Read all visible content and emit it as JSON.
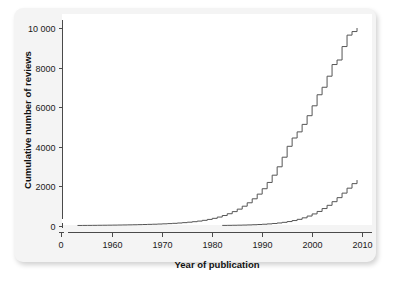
{
  "figure": {
    "panel_background": "#f4f4f4",
    "plot_background": "#ffffff",
    "line_color": "#555555",
    "axis_color": "#4a4a4a"
  },
  "chart_data": {
    "type": "line",
    "title": "",
    "subtitle": "",
    "xlabel": "Year of publication",
    "ylabel": "Cumulative number of reviews",
    "xlim": [
      1950,
      2012
    ],
    "ylim": [
      0,
      10400
    ],
    "grid": false,
    "legend": null,
    "legend_position": "none",
    "xticks": [
      0,
      1960,
      1970,
      1980,
      1990,
      2000,
      2010
    ],
    "xtick_labels": [
      "0",
      "1960",
      "1970",
      "1980",
      "1990",
      "2000",
      "2010"
    ],
    "yticks": [
      0,
      2000,
      4000,
      6000,
      8000,
      10000
    ],
    "ytick_labels": [
      "0",
      "2000",
      "4000",
      "6000",
      "8000",
      "10 000"
    ],
    "axis_break_x": true,
    "axis_break_y": true,
    "step_type": "post",
    "series": [
      {
        "name": "upper-curve",
        "style": "step",
        "x": [
          1953,
          1954,
          1955,
          1956,
          1957,
          1958,
          1959,
          1960,
          1961,
          1962,
          1963,
          1964,
          1965,
          1966,
          1967,
          1968,
          1969,
          1970,
          1971,
          1972,
          1973,
          1974,
          1975,
          1976,
          1977,
          1978,
          1979,
          1980,
          1981,
          1982,
          1983,
          1984,
          1985,
          1986,
          1987,
          1988,
          1989,
          1990,
          1991,
          1992,
          1993,
          1994,
          1995,
          1996,
          1997,
          1998,
          1999,
          2000,
          2001,
          2002,
          2003,
          2004,
          2005,
          2006,
          2007,
          2008,
          2009
        ],
        "values": [
          2,
          4,
          6,
          8,
          11,
          14,
          17,
          20,
          24,
          28,
          33,
          38,
          44,
          50,
          57,
          65,
          74,
          84,
          96,
          110,
          126,
          145,
          167,
          193,
          224,
          262,
          308,
          363,
          428,
          505,
          596,
          703,
          829,
          977,
          1150,
          1352,
          1588,
          1862,
          2180,
          2548,
          2972,
          3458,
          4010,
          4430,
          4740,
          5120,
          5560,
          6060,
          6620,
          7000,
          7560,
          8150,
          8380,
          9060,
          9640,
          9820,
          10000
        ]
      },
      {
        "name": "lower-curve",
        "style": "step",
        "x": [
          1982,
          1983,
          1984,
          1985,
          1986,
          1987,
          1988,
          1989,
          1990,
          1991,
          1992,
          1993,
          1994,
          1995,
          1996,
          1997,
          1998,
          1999,
          2000,
          2001,
          2002,
          2003,
          2004,
          2005,
          2006,
          2007,
          2008,
          2009
        ],
        "values": [
          5,
          8,
          12,
          17,
          23,
          30,
          39,
          50,
          64,
          81,
          102,
          128,
          160,
          200,
          250,
          312,
          388,
          478,
          586,
          712,
          858,
          1022,
          1206,
          1410,
          1640,
          1890,
          2120,
          2300
        ]
      }
    ]
  }
}
